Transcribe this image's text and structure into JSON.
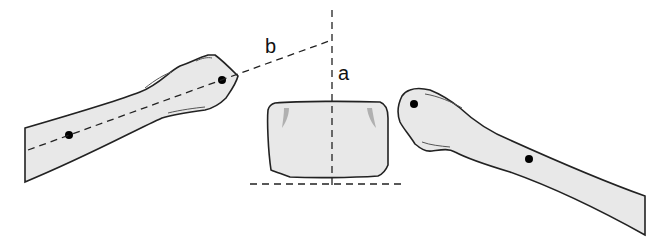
{
  "diagram": {
    "labels": {
      "b": "b",
      "a": "a"
    },
    "colors": {
      "fill": "#e8e8e8",
      "stroke": "#222222",
      "shade": "#b0b0b0",
      "dot": "#000000"
    },
    "elements": [
      {
        "id": "left-bone",
        "type": "elongated bone, head pointing right-up",
        "dots": 2
      },
      {
        "id": "center-block",
        "type": "rounded rectangular vertebra block"
      },
      {
        "id": "right-bone",
        "type": "elongated bone, head pointing left"
      },
      {
        "id": "line-b",
        "type": "dashed axis line through left bone"
      },
      {
        "id": "line-a",
        "type": "vertical dashed line"
      },
      {
        "id": "baseline",
        "type": "horizontal dashed baseline"
      }
    ]
  }
}
